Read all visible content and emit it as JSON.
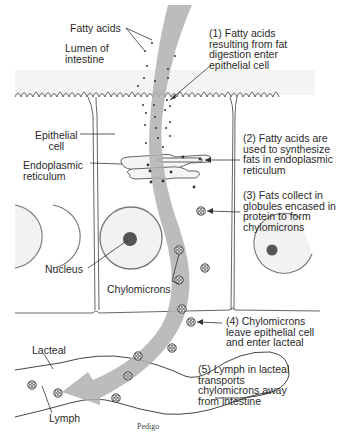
{
  "figure": {
    "cut_off_caption": "Figure  Fat absorption (fatty acids)",
    "credit": "Pedigo",
    "colors": {
      "line": "#555555",
      "arrow": "#b0b0b0",
      "lumen_shade": "#e8e8e8",
      "nucleus_fill": "#f2f2f2",
      "nucleolus": "#555555",
      "dots": "#333333",
      "text": "#2a2a2a"
    }
  },
  "labels": {
    "fatty_acids": "Fatty acids",
    "lumen": "Lumen of\nintestine",
    "epithelial_cell": "Epithelial\ncell",
    "endoplasmic_reticulum": "Endoplasmic\nreticulum",
    "nucleus": "Nucleus",
    "chylomicrons": "Chylomicrons",
    "lacteal": "Lacteal",
    "lymph": "Lymph"
  },
  "steps": [
    {
      "number": "(1)",
      "text": "(1) Fatty acids\nresulting from fat\ndigestion enter\nepithelial cell"
    },
    {
      "number": "(2)",
      "text": "(2) Fatty acids are\nused to synthesize\nfats in endoplasmic\nreticulum"
    },
    {
      "number": "(3)",
      "text": "(3) Fats collect in\nglobules encased in\nprotein to form\nchylomicrons"
    },
    {
      "number": "(4)",
      "text": "(4) Chylomicrons\nleave epithelial cell\nand enter lacteal"
    },
    {
      "number": "(5)",
      "text": "(5) Lymph in lacteal\ntransports\nchylomicrons away\nfrom intestine"
    }
  ]
}
